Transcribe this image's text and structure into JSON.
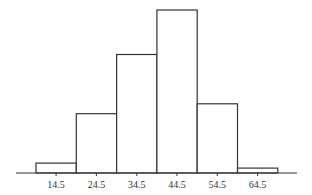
{
  "chart_data": {
    "type": "bar",
    "subtype": "histogram",
    "title": "",
    "xlabel": "",
    "ylabel": "",
    "categories": [
      "14.5",
      "24.5",
      "34.5",
      "44.5",
      "54.5",
      "64.5"
    ],
    "tick_labels": [
      "14.5",
      "24.5",
      "34.5",
      "44.5",
      "54.5",
      "64.5"
    ],
    "bin_edges": [
      9.5,
      19.5,
      29.5,
      39.5,
      49.5,
      59.5,
      69.5
    ],
    "values": [
      2,
      12,
      24,
      33,
      14,
      1
    ],
    "y_axis_shown": false,
    "grid": false,
    "legend": null,
    "bar_fill": "#ffffff",
    "bar_stroke": "#333333"
  }
}
